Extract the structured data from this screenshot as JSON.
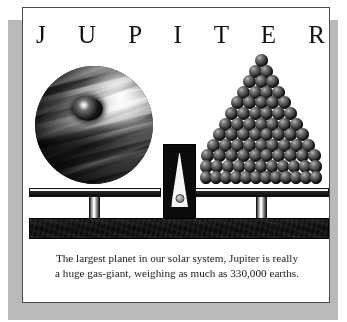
{
  "page": {
    "title": "J U P I T E R",
    "background_color": "#ffffff",
    "frame_border_color": "#4a4a4a",
    "shadow_color": "#b9b9b9"
  },
  "illustration": {
    "name": "balance-scale-jupiter-vs-earths",
    "left_pan_object": "jupiter-planet-sphere",
    "right_pan_object": "pyramid-of-earth-spheres",
    "fulcrum": "triangular-wedge-pivot",
    "pyramid_rows": [
      1,
      2,
      3,
      4,
      5,
      6,
      7,
      8,
      9,
      10,
      11,
      12
    ],
    "pyramid_row_count": 12,
    "colors": {
      "planet_highlight": "#ffffff",
      "planet_shadow": "#0b0b0b",
      "ball_fill": "#2e2e2e",
      "metal_light": "#f2f2f2",
      "metal_dark": "#0d0d0d",
      "base_bar": "#0a0a0a"
    }
  },
  "caption": {
    "line1": "The largest planet in our solar system, Jupiter is really",
    "line2": "a huge gas-giant, weighing as much as 330,000 earths.",
    "facts": {
      "weight_in_earths": "330,000"
    }
  }
}
